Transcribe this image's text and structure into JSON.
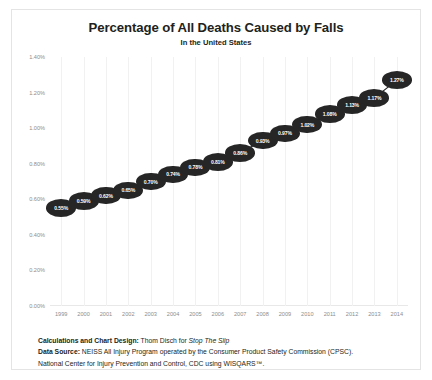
{
  "chart_data": {
    "type": "line",
    "title": "Percentage of All Deaths Caused by Falls",
    "subtitle": "In the United States",
    "xlabel": "",
    "ylabel": "",
    "grid": "vertical",
    "legend": "none",
    "ylim": [
      0,
      1.4
    ],
    "ytick_labels": [
      "1.40%",
      "1.20%",
      "1.00%",
      "0.80%",
      "0.60%",
      "0.40%",
      "0.20%",
      "0.00%"
    ],
    "ytick_values": [
      1.4,
      1.2,
      1.0,
      0.8,
      0.6,
      0.4,
      0.2,
      0.0
    ],
    "categories": [
      "1999",
      "2000",
      "2001",
      "2002",
      "2003",
      "2004",
      "2005",
      "2006",
      "2007",
      "2008",
      "2009",
      "2010",
      "2011",
      "2012",
      "2013",
      "2014"
    ],
    "values": [
      0.55,
      0.59,
      0.62,
      0.65,
      0.7,
      0.74,
      0.78,
      0.81,
      0.86,
      0.93,
      0.97,
      1.02,
      1.08,
      1.13,
      1.17,
      1.27
    ],
    "point_labels": [
      "0.55%",
      "0.59%",
      "0.62%",
      "0.65%",
      "0.70%",
      "0.74%",
      "0.78%",
      "0.81%",
      "0.86%",
      "0.93%",
      "0.97%",
      "1.02%",
      "1.08%",
      "1.13%",
      "1.17%",
      "1.27%"
    ],
    "marker_color": "#262626",
    "marker_text_color": "#ffffff",
    "line_color": "#262626",
    "grid_color": "#f1f1f1"
  },
  "footer": {
    "credit_label": "Calculations and Chart Design:",
    "credit_text": "Thom Disch for",
    "credit_italic": "Stop The Slip",
    "source_label": "Data Source:",
    "source_line1": "NEISS All Injury Program operated by the Consumer Product Safety Commission (CPSC).",
    "source_line2": "National Center for Injury Prevention and Control, CDC using WISQARS™."
  }
}
